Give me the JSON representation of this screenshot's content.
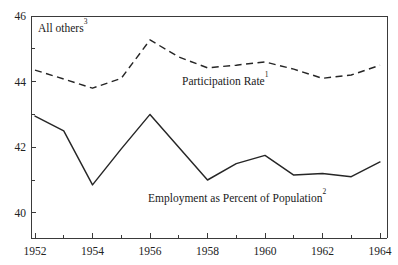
{
  "chart_data": {
    "type": "line",
    "title": "",
    "subtitle": "",
    "xlabel": "",
    "ylabel": "",
    "xlim": [
      1952,
      1964
    ],
    "ylim": [
      39.2,
      46
    ],
    "grid": false,
    "legend_position": "inline-annotations",
    "x": [
      1952,
      1953,
      1954,
      1955,
      1956,
      1957,
      1958,
      1959,
      1960,
      1961,
      1962,
      1963,
      1964
    ],
    "y_ticks_major": [
      40,
      42,
      44,
      46
    ],
    "y_tick_labels": [
      "40",
      "42",
      "44",
      "46"
    ],
    "y_ticks_minor": [
      41,
      43,
      45
    ],
    "x_ticks_major": [
      1952,
      1954,
      1956,
      1958,
      1960,
      1962,
      1964
    ],
    "x_tick_labels": [
      "1952",
      "1954",
      "1956",
      "1958",
      "1960",
      "1962",
      "1964"
    ],
    "x_ticks_minor": [
      1953,
      1955,
      1957,
      1959,
      1961,
      1963
    ],
    "series": [
      {
        "name": "Participation Rate",
        "style": "dashed",
        "color": "#262626",
        "values": [
          44.35,
          44.08,
          43.8,
          44.1,
          45.27,
          44.75,
          44.42,
          44.5,
          44.6,
          44.38,
          44.1,
          44.2,
          44.5
        ]
      },
      {
        "name": "Employment as Percent of Population",
        "style": "solid",
        "color": "#262626",
        "values": [
          42.95,
          42.5,
          40.85,
          41.95,
          43.0,
          42.0,
          41.0,
          41.5,
          41.75,
          41.15,
          41.2,
          41.1,
          41.55
        ]
      }
    ],
    "annotations": [
      {
        "name": "all-others-label",
        "text": "All others",
        "superscript": "3",
        "x_px": 38,
        "y_px": 32
      },
      {
        "name": "participation-rate-label",
        "text": "Participation Rate",
        "superscript": "1",
        "x_px": 182,
        "y_px": 85
      },
      {
        "name": "employment-percent-label",
        "text": "Employment as Percent of Population",
        "superscript": "2",
        "x_px": 148,
        "y_px": 202
      }
    ]
  },
  "geometry": {
    "plot_left": 31,
    "plot_right": 387,
    "plot_top": 16,
    "plot_bottom": 238,
    "x_start_px": 35,
    "x_end_px": 380,
    "y_value_top": 46,
    "y_value_top_px": 16,
    "px_per_unit": 32.8,
    "tick_len_major": 5,
    "tick_len_minor": 3
  },
  "colors": {
    "line": "#262626",
    "axis": "#3a3a3a",
    "text": "#1a1a1a",
    "background": "#ffffff"
  }
}
